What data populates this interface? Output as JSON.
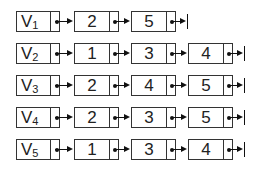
{
  "diagram": {
    "type": "adjacency-list",
    "lists": [
      {
        "head": "V",
        "subscript": "1",
        "nodes": [
          "2",
          "5"
        ]
      },
      {
        "head": "V",
        "subscript": "2",
        "nodes": [
          "1",
          "3",
          "4"
        ]
      },
      {
        "head": "V",
        "subscript": "3",
        "nodes": [
          "2",
          "4",
          "5"
        ]
      },
      {
        "head": "V",
        "subscript": "4",
        "nodes": [
          "2",
          "3",
          "5"
        ]
      },
      {
        "head": "V",
        "subscript": "5",
        "nodes": [
          "1",
          "3",
          "4"
        ]
      }
    ],
    "colors": {
      "border": "#333333",
      "pointer": "#111111",
      "text": "#222222",
      "background": "#ffffff"
    }
  }
}
